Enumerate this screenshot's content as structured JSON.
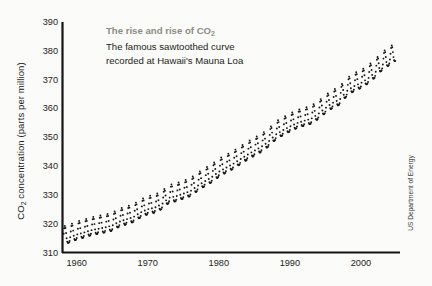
{
  "figure": {
    "title_line1": "The rise and rise of CO₂",
    "title_line2": "The famous sawtoothed curve",
    "title_line3": "recorded at Hawaii's Mauna Loa",
    "title_color": "#8d8b84",
    "body_color": "#1b1b1b",
    "credit": "US Department of Energy",
    "background": "#fbfbfa"
  },
  "chart_data": {
    "type": "line",
    "title": "The rise and rise of CO2",
    "subtitle": "The famous sawtoothed curve recorded at Hawaii's Mauna Loa",
    "xlabel": "",
    "ylabel": "CO₂ concentration (parts per million)",
    "xlim": [
      1958,
      2005.5
    ],
    "ylim": [
      310,
      390
    ],
    "xticks": [
      1960,
      1970,
      1980,
      1990,
      2000
    ],
    "xtick_labels": [
      "1960",
      "1970",
      "1980",
      "1990",
      "2000"
    ],
    "yticks": [
      310,
      320,
      330,
      340,
      350,
      360,
      370,
      380,
      390
    ],
    "ytick_labels": [
      "310",
      "320",
      "330",
      "340",
      "350",
      "360",
      "370",
      "380",
      "390"
    ],
    "grid": false,
    "legend": "none",
    "marker": "dot",
    "series_name": "Mauna Loa monthly mean CO2",
    "series_color": "#161616",
    "annual_cycle_amplitude_ppm": 6.2,
    "annual_peak_month": 5,
    "annual_trough_month": 9,
    "annual_means": {
      "x": [
        1958,
        1959,
        1960,
        1961,
        1962,
        1963,
        1964,
        1965,
        1966,
        1967,
        1968,
        1969,
        1970,
        1971,
        1972,
        1973,
        1974,
        1975,
        1976,
        1977,
        1978,
        1979,
        1980,
        1981,
        1982,
        1983,
        1984,
        1985,
        1986,
        1987,
        1988,
        1989,
        1990,
        1991,
        1992,
        1993,
        1994,
        1995,
        1996,
        1997,
        1998,
        1999,
        2000,
        2001,
        2002,
        2003,
        2004
      ],
      "y": [
        315.2,
        315.9,
        316.9,
        317.6,
        318.4,
        318.9,
        319.4,
        320.0,
        321.4,
        322.2,
        323.0,
        324.6,
        325.7,
        326.3,
        327.5,
        329.7,
        330.2,
        331.1,
        332.0,
        333.8,
        335.4,
        336.8,
        338.7,
        340.1,
        341.4,
        343.0,
        344.6,
        346.0,
        347.4,
        349.2,
        351.6,
        353.1,
        354.4,
        355.6,
        356.4,
        357.1,
        358.8,
        360.8,
        362.6,
        363.7,
        366.7,
        368.4,
        369.5,
        371.1,
        373.2,
        375.8,
        377.5
      ]
    },
    "observed_range_ppm": [
      313.0,
      381.5
    ],
    "source": "US Department of Energy"
  }
}
